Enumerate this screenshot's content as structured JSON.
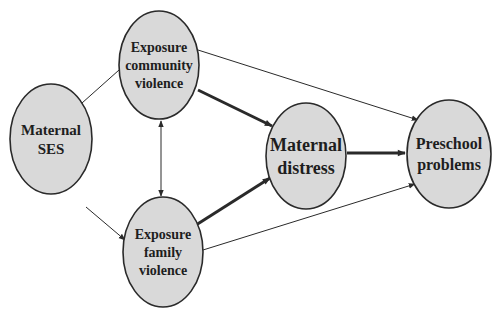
{
  "diagram": {
    "type": "path-model",
    "colors": {
      "node_fill": "#d9d9d9",
      "node_stroke": "#2a2a2a",
      "edge": "#2a2a2a",
      "background": "#ffffff"
    },
    "nodes": [
      {
        "id": "ses",
        "lines": [
          "Maternal",
          "SES"
        ],
        "cx": 51,
        "cy": 139,
        "rx": 41,
        "ry": 55,
        "font_size": 15
      },
      {
        "id": "community",
        "lines": [
          "Exposure",
          "community",
          "violence"
        ],
        "cx": 159,
        "cy": 65,
        "rx": 40,
        "ry": 54,
        "font_size": 14
      },
      {
        "id": "family",
        "lines": [
          "Exposure",
          "family",
          "violence"
        ],
        "cx": 163,
        "cy": 252,
        "rx": 40,
        "ry": 55,
        "font_size": 14
      },
      {
        "id": "distress",
        "lines": [
          "Maternal",
          "distress"
        ],
        "cx": 306,
        "cy": 156,
        "rx": 40,
        "ry": 53,
        "font_size": 18
      },
      {
        "id": "preschool",
        "lines": [
          "Preschool",
          "problems"
        ],
        "cx": 449,
        "cy": 154,
        "rx": 42,
        "ry": 54,
        "font_size": 16
      }
    ],
    "edges": [
      {
        "from": "ses",
        "to": "community",
        "weight": "thin",
        "x1": 82,
        "y1": 103,
        "x2": 128,
        "y2": 62
      },
      {
        "from": "ses",
        "to": "family",
        "weight": "thin",
        "x1": 86,
        "y1": 207,
        "x2": 125,
        "y2": 240
      },
      {
        "from": "community",
        "to": "family",
        "weight": "thin",
        "bidirectional": true,
        "x1": 161,
        "y1": 121,
        "x2": 161,
        "y2": 196
      },
      {
        "from": "community",
        "to": "distress",
        "weight": "thick",
        "x1": 198,
        "y1": 90,
        "x2": 272,
        "y2": 126
      },
      {
        "from": "family",
        "to": "distress",
        "weight": "thick",
        "x1": 196,
        "y1": 225,
        "x2": 270,
        "y2": 178
      },
      {
        "from": "community",
        "to": "preschool",
        "weight": "thin",
        "x1": 198,
        "y1": 50,
        "x2": 418,
        "y2": 120
      },
      {
        "from": "family",
        "to": "preschool",
        "weight": "thin",
        "x1": 203,
        "y1": 250,
        "x2": 415,
        "y2": 184
      },
      {
        "from": "distress",
        "to": "preschool",
        "weight": "thick",
        "x1": 347,
        "y1": 153,
        "x2": 405,
        "y2": 153
      }
    ]
  }
}
